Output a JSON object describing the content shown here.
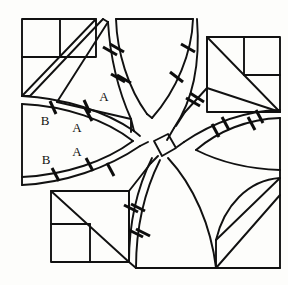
{
  "figure": {
    "kind": "geometric-diagram",
    "canvas": {
      "width": 288,
      "height": 285
    },
    "stroke_color": "#111111",
    "background_color": "#fdfdfb",
    "line_width": 1.9,
    "tick_color": "#0d0d0d"
  },
  "labels": [
    {
      "id": "label-a-top",
      "text": "A",
      "x": 104,
      "y": 98
    },
    {
      "id": "label-b-upper",
      "text": "B",
      "x": 45,
      "y": 122
    },
    {
      "id": "label-a-upper",
      "text": "A",
      "x": 77,
      "y": 129
    },
    {
      "id": "label-a-lower",
      "text": "A",
      "x": 77,
      "y": 153
    },
    {
      "id": "label-b-lower",
      "text": "B",
      "x": 46,
      "y": 161
    }
  ],
  "ticks": {
    "count": 22,
    "meaning": "congruence hatch marks across curved band edges",
    "length": 11
  },
  "regions": [
    {
      "id": "top-left-square",
      "name": "top-left subdivided square with diagonal"
    },
    {
      "id": "top-right-square",
      "name": "top-right subdivided square with diagonal"
    },
    {
      "id": "bottom-left-square",
      "name": "bottom-left subdivided square with diagonal"
    },
    {
      "id": "bottom-right-fan",
      "name": "bottom-right fan region"
    },
    {
      "id": "left-arrowhead",
      "name": "left curved arrowhead region"
    },
    {
      "id": "right-arrowhead",
      "name": "right curved arrowhead region"
    },
    {
      "id": "top-wedge",
      "name": "top curved wedge"
    },
    {
      "id": "bottom-wedge",
      "name": "bottom curved wedge"
    },
    {
      "id": "center-square",
      "name": "small central square at band crossing"
    }
  ]
}
